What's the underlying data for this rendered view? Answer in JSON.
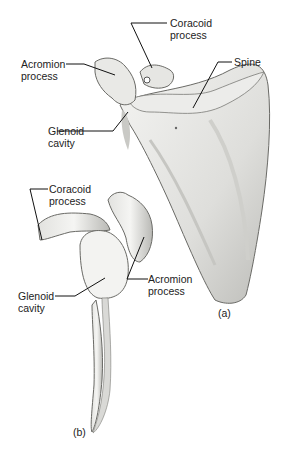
{
  "figure": {
    "panel_a": {
      "tag": "(a)",
      "labels": {
        "coracoid": [
          "Coracoid",
          "process"
        ],
        "acromion": [
          "Acromion",
          "process"
        ],
        "spine": [
          "Spine"
        ],
        "glenoid": [
          "Glenoid",
          "cavity"
        ]
      }
    },
    "panel_b": {
      "tag": "(b)",
      "labels": {
        "coracoid": [
          "Coracoid",
          "process"
        ],
        "acromion": [
          "Acromion",
          "process"
        ],
        "glenoid": [
          "Glenoid",
          "cavity"
        ]
      }
    },
    "colors": {
      "bone_light": "#f2f2f0",
      "bone_shade": "#b8b8b4",
      "outline": "#6a6a66",
      "leader": "#111111"
    }
  }
}
